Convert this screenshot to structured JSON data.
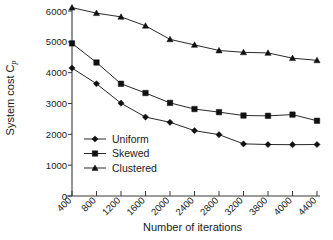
{
  "chart_data": {
    "type": "line",
    "title": "",
    "xlabel": "Number of iterations",
    "ylabel": "System cost C",
    "ylabel_symbol": "C",
    "ylabel_subscript": "p",
    "categories": [
      "400",
      "800",
      "1200",
      "1600",
      "2000",
      "2400",
      "2800",
      "3200",
      "3800",
      "4000",
      "4400"
    ],
    "x": [
      400,
      800,
      1200,
      1600,
      2000,
      2400,
      2800,
      3200,
      3800,
      4000,
      4400
    ],
    "xtick_labels": [
      "400",
      "800",
      "1200",
      "1600",
      "2000",
      "2400",
      "2800",
      "3200",
      "3800",
      "4000",
      "4400"
    ],
    "ytick_labels": [
      "0",
      "1000",
      "2000",
      "3000",
      "4000",
      "5000",
      "6000"
    ],
    "yticks": [
      0,
      1000,
      2000,
      3000,
      4000,
      5000,
      6000
    ],
    "ylim": [
      0,
      6000
    ],
    "grid": false,
    "legend_position": "inside-lower-left",
    "series": [
      {
        "name": "Uniform",
        "marker": "diamond",
        "color": "#111111",
        "values": [
          4150,
          3640,
          3010,
          2560,
          2390,
          2120,
          1990,
          1690,
          1670,
          1665,
          1670
        ]
      },
      {
        "name": "Skewed",
        "marker": "square",
        "color": "#111111",
        "values": [
          4950,
          4330,
          3640,
          3340,
          3020,
          2820,
          2720,
          2610,
          2600,
          2640,
          2440
        ]
      },
      {
        "name": "Clustered",
        "marker": "triangle",
        "color": "#111111",
        "values": [
          6110,
          5930,
          5810,
          5520,
          5080,
          4900,
          4720,
          4660,
          4640,
          4470,
          4400
        ]
      }
    ]
  },
  "legend": {
    "items": [
      {
        "label": "Uniform"
      },
      {
        "label": "Skewed"
      },
      {
        "label": "Clustered"
      }
    ]
  }
}
